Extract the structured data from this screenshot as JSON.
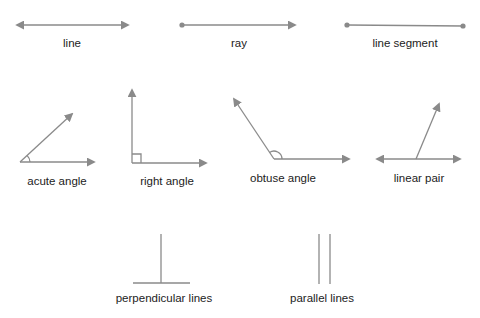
{
  "colors": {
    "stroke": "#8a8a8a",
    "text": "#222222",
    "background": "#ffffff"
  },
  "figures": [
    {
      "id": "line",
      "label": "line"
    },
    {
      "id": "ray",
      "label": "ray"
    },
    {
      "id": "line-segment",
      "label": "line segment"
    },
    {
      "id": "acute-angle",
      "label": "acute angle"
    },
    {
      "id": "right-angle",
      "label": "right angle"
    },
    {
      "id": "obtuse-angle",
      "label": "obtuse angle"
    },
    {
      "id": "linear-pair",
      "label": "linear pair"
    },
    {
      "id": "perpendicular-lines",
      "label": "perpendicular lines"
    },
    {
      "id": "parallel-lines",
      "label": "parallel lines"
    }
  ]
}
